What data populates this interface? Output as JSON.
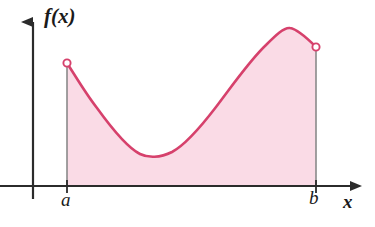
{
  "figure": {
    "kind": "calculus-area-under-curve-diagram",
    "background_color": "#ffffff"
  },
  "labels": {
    "function_label": "f(x)",
    "x_axis_label": "x",
    "lower_limit": "a",
    "upper_limit": "b"
  },
  "colors": {
    "curve_stroke": "#d6416c",
    "region_fill": "#fadbe6",
    "axis": "#2b2b2b",
    "boundary_line": "#8a8a8a",
    "endpoint_marker_fill": "#ffffff",
    "text": "#1a1a1a"
  },
  "axes": {
    "x_axis_y": 186,
    "y_axis_x": 33,
    "x_axis_start_x": 0,
    "x_axis_end_x": 362,
    "y_axis_top_y": 10,
    "y_axis_bottom_y": 199,
    "arrowheads": [
      "x-axis-right",
      "y-axis-up"
    ],
    "grid": false
  },
  "chart_data": {
    "type": "area",
    "xlabel": "x",
    "ylabel": "f(x)",
    "x_tick_labels": [
      "a",
      "b"
    ],
    "x_tick_positions": [
      67,
      316
    ],
    "y_tick_labels": [],
    "grid": false,
    "legend_position": "none",
    "baseline_y": 186,
    "endpoints": {
      "left": {
        "label": "a",
        "x": 67,
        "y": 63,
        "marker": "open-circle"
      },
      "right": {
        "label": "b",
        "x": 316,
        "y": 47,
        "marker": "open-circle"
      }
    },
    "features": {
      "local_minimum": {
        "x": 152,
        "y": 157
      },
      "local_maximum": {
        "x": 285,
        "y": 28
      }
    },
    "curve_points": [
      [
        67,
        63
      ],
      [
        80,
        83
      ],
      [
        93,
        102
      ],
      [
        106,
        119
      ],
      [
        119,
        134
      ],
      [
        131,
        145
      ],
      [
        142,
        153
      ],
      [
        152,
        157
      ],
      [
        163,
        156
      ],
      [
        174,
        151
      ],
      [
        186,
        142
      ],
      [
        198,
        130
      ],
      [
        210,
        116
      ],
      [
        222,
        100
      ],
      [
        234,
        84
      ],
      [
        246,
        68
      ],
      [
        258,
        54
      ],
      [
        270,
        41
      ],
      [
        282,
        31
      ],
      [
        290,
        28
      ],
      [
        300,
        32
      ],
      [
        308,
        39
      ],
      [
        316,
        47
      ]
    ]
  }
}
